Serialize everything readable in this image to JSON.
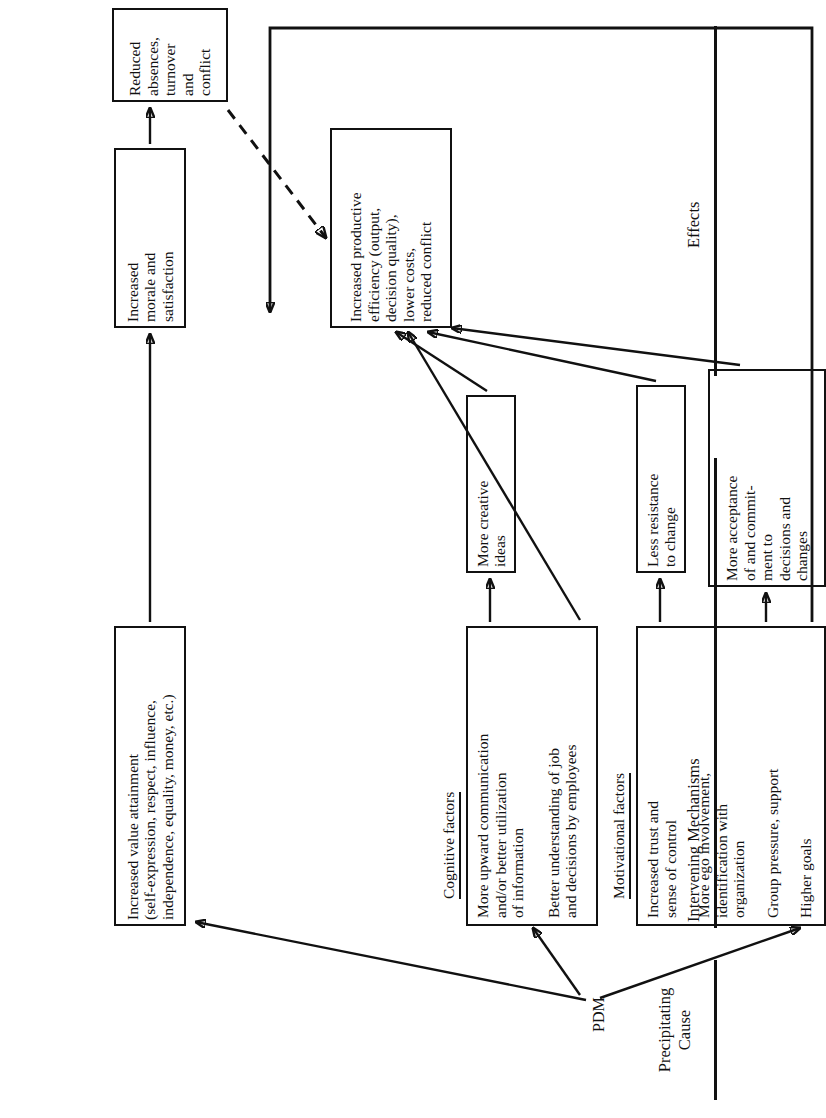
{
  "figure": {
    "orientation": "rotated-90-ccw",
    "ink_color": "#111111",
    "paper_color": "#ffffff"
  },
  "sections": [
    {
      "id": "precipitating-cause",
      "label_line1": "Precipitating",
      "label_line2": "Cause"
    },
    {
      "id": "intervening-mechanisms",
      "label_line1": "Intervening Mechanisms",
      "label_line2": ""
    },
    {
      "id": "effects",
      "label_line1": "Effects",
      "label_line2": ""
    }
  ],
  "subheadings": [
    {
      "id": "cognitive-factors",
      "label": "Cognitive factors"
    },
    {
      "id": "motivational-factors",
      "label": "Motivational factors"
    }
  ],
  "nodes": {
    "pdm": {
      "label": "PDM"
    },
    "value_attainment": {
      "lines": [
        "Increased value attainment",
        "(self-expression, respect, influence,",
        "independence, equality, money, etc.)"
      ]
    },
    "upward_communication": {
      "lines": [
        "More upward communication",
        "and/or better utilization",
        "of information"
      ]
    },
    "better_understanding": {
      "lines": [
        "Better understanding of job",
        "and decisions by employees"
      ]
    },
    "trust_control": {
      "lines": [
        "Increased trust and",
        "sense of control"
      ]
    },
    "ego_involvement": {
      "lines": [
        "More ego involvement,",
        "identification with",
        "organization"
      ]
    },
    "group_pressure": {
      "lines": [
        "Group pressure, support"
      ]
    },
    "higher_goals": {
      "lines": [
        "Higher goals"
      ]
    },
    "creative_ideas": {
      "lines": [
        "More creative",
        "ideas"
      ]
    },
    "less_resistance": {
      "lines": [
        "Less resistance",
        "to change"
      ]
    },
    "more_acceptance": {
      "lines": [
        "More acceptance",
        "of and commit-",
        "ment to",
        "decisions and",
        "changes"
      ]
    },
    "morale_satisfaction": {
      "lines": [
        "Increased",
        "morale and",
        "satisfaction"
      ]
    },
    "reduced_absences": {
      "lines": [
        "Reduced",
        "absences,",
        "turnover",
        "and",
        "conflict"
      ]
    },
    "productive_efficiency": {
      "lines": [
        "Increased productive",
        "efficiency (output,",
        "decision quality),",
        "lower costs,",
        "reduced conflict"
      ]
    }
  },
  "edges": [
    {
      "from": "pdm",
      "to": "value_attainment",
      "style": "solid"
    },
    {
      "from": "pdm",
      "to": "cognitive-factors-group",
      "style": "solid"
    },
    {
      "from": "pdm",
      "to": "motivational-factors-group",
      "style": "solid"
    },
    {
      "from": "value_attainment",
      "to": "morale_satisfaction",
      "style": "solid"
    },
    {
      "from": "morale_satisfaction",
      "to": "reduced_absences",
      "style": "solid"
    },
    {
      "from": "reduced_absences",
      "to": "productive_efficiency",
      "style": "dashed"
    },
    {
      "from": "upward_communication",
      "to": "creative_ideas",
      "style": "solid"
    },
    {
      "from": "creative_ideas",
      "to": "productive_efficiency",
      "style": "solid"
    },
    {
      "from": "better_understanding",
      "to": "productive_efficiency",
      "style": "solid"
    },
    {
      "from": "trust_control",
      "to": "less_resistance",
      "style": "solid"
    },
    {
      "from": "less_resistance",
      "to": "productive_efficiency",
      "style": "solid"
    },
    {
      "from": "ego_involvement_group",
      "to": "more_acceptance",
      "style": "solid"
    },
    {
      "from": "more_acceptance",
      "to": "productive_efficiency",
      "style": "solid"
    },
    {
      "from": "higher_goals",
      "to": "productive_efficiency",
      "style": "solid-elbow"
    }
  ]
}
